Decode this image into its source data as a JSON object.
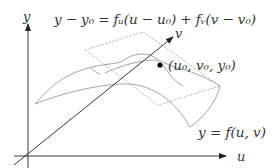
{
  "figure": {
    "labels": {
      "equation": "y − y₀ = fᵤ(u − u₀) + fᵥ(v − v₀)",
      "y_axis": "y",
      "u_axis": "u",
      "v_axis": "v",
      "point": "(u₀, v₀, y₀)",
      "surface": "y = f(u, v)"
    },
    "elements": {
      "axes": [
        "y",
        "u",
        "v"
      ],
      "surface": "curved patch y = f(u,v)",
      "tangent_plane": "dashed quadrilateral",
      "point_marker": "filled dot at (u₀, v₀, y₀)"
    },
    "colors": {
      "axis": "#222222",
      "surface": "#9a9a9a",
      "plane": "#9a9a9a",
      "text": "#333333",
      "point": "#000000"
    }
  }
}
